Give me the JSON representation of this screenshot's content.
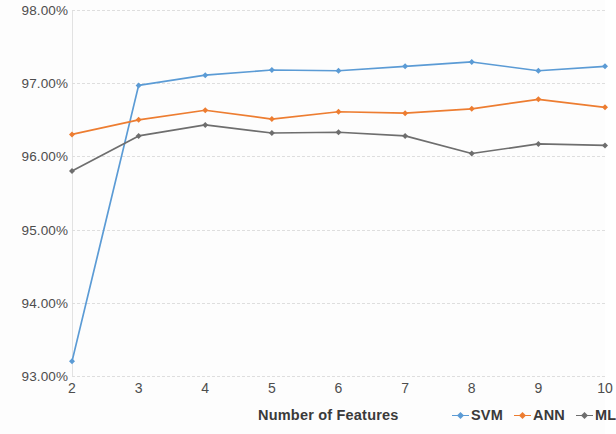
{
  "chart_data": {
    "type": "line",
    "title": "",
    "xlabel": "Number of Features",
    "ylabel": "",
    "categories": [
      2,
      3,
      4,
      5,
      6,
      7,
      8,
      9,
      10
    ],
    "x_tick_labels": [
      "2",
      "3",
      "4",
      "5",
      "6",
      "7",
      "8",
      "9",
      "10"
    ],
    "y_tick_labels": [
      "98.00%",
      "97.00%",
      "96.00%",
      "95.00%",
      "94.00%",
      "93.00%"
    ],
    "y_tick_values": [
      98.0,
      97.0,
      96.0,
      95.0,
      94.0,
      93.0
    ],
    "ylim": [
      93.0,
      98.0
    ],
    "xlim": [
      2,
      10
    ],
    "grid": "horizontal-dashed",
    "legend_position": "bottom-right",
    "series": [
      {
        "name": "SVM",
        "color": "#5B9BD5",
        "marker": "diamond",
        "values": [
          93.2,
          96.97,
          97.11,
          97.18,
          97.17,
          97.23,
          97.29,
          97.17,
          97.23
        ]
      },
      {
        "name": "ANN",
        "color": "#ED7D31",
        "marker": "diamond",
        "values": [
          96.3,
          96.5,
          96.63,
          96.51,
          96.61,
          96.59,
          96.65,
          96.78,
          96.67
        ]
      },
      {
        "name": "ML",
        "color": "#6E6E6E",
        "marker": "diamond",
        "values": [
          95.8,
          96.28,
          96.43,
          96.32,
          96.33,
          96.28,
          96.04,
          96.17,
          96.15
        ]
      }
    ]
  },
  "axis": {
    "x_title": "Number of Features"
  },
  "legend": {
    "entries": [
      {
        "label": "SVM",
        "color": "#5B9BD5"
      },
      {
        "label": "ANN",
        "color": "#ED7D31"
      },
      {
        "label": "ML",
        "color": "#6E6E6E"
      }
    ]
  },
  "colors": {
    "grid": "#dedede",
    "tick_text": "#4d4d4d",
    "title_text": "#3a3a3a",
    "background": "#fdfdfd"
  }
}
